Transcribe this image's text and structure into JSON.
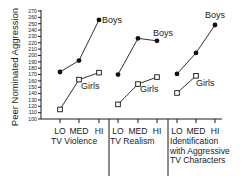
{
  "chart_data": {
    "type": "line",
    "title": "",
    "ylabel": "Peer Nominated Aggression",
    "xlabel": "",
    "ylim": [
      100,
      270
    ],
    "yticks": [
      100,
      110,
      120,
      130,
      140,
      150,
      160,
      170,
      180,
      190,
      200,
      210,
      220,
      230,
      240,
      250,
      260,
      270
    ],
    "grid": false,
    "legend": "inline labels",
    "groups": [
      {
        "name": "TV Violence",
        "label_lines": [
          "TV Violence"
        ],
        "categories": [
          "LO",
          "MED",
          "HI"
        ],
        "series": [
          {
            "name": "Boys",
            "values": [
              174,
              192,
              256
            ]
          },
          {
            "name": "Girls",
            "values": [
              115,
              162,
              173
            ]
          }
        ]
      },
      {
        "name": "TV Realism",
        "label_lines": [
          "TV Realism"
        ],
        "categories": [
          "LO",
          "MED",
          "HI"
        ],
        "series": [
          {
            "name": "Boys",
            "values": [
              170,
              227,
              223
            ]
          },
          {
            "name": "Girls",
            "values": [
              123,
              155,
              166
            ]
          }
        ]
      },
      {
        "name": "Identification with Aggressive TV Characters",
        "label_lines": [
          "Identification",
          "with Aggressive",
          "TV Characters"
        ],
        "categories": [
          "LO",
          "MED",
          "HI"
        ],
        "series": [
          {
            "name": "Boys",
            "values": [
              171,
              204,
              248
            ]
          },
          {
            "name": "Girls",
            "values": [
              141,
              168,
              null
            ]
          }
        ]
      }
    ]
  }
}
